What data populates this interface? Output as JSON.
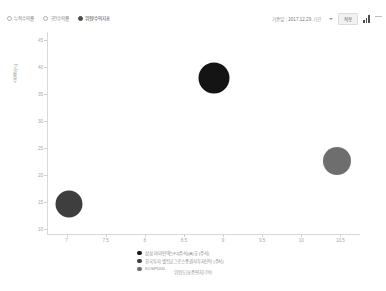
{
  "toolbar": {
    "view_options": [
      {
        "label": "누적수익률",
        "selected": false
      },
      {
        "label": "구간수익률",
        "selected": false
      },
      {
        "label": "위험/수익지표",
        "selected": true
      }
    ],
    "date_label": "기준일",
    "date_value": ": 2017.12.29",
    "date_unit": "기간",
    "apply_label": "적용",
    "chart_icon": "bar-chart-icon",
    "more_icon": "more-menu-icon"
  },
  "chart_data": {
    "type": "scatter",
    "title": "",
    "xlabel": "위험도(표준편차) (%)",
    "ylabel": "수익률 (%)",
    "xlim": [
      6.75,
      10.75
    ],
    "ylim": [
      9.0,
      46.5
    ],
    "xticks": [
      "7",
      "7.5",
      "8",
      "8.5",
      "9",
      "9.5",
      "10",
      "10.5"
    ],
    "xtick_values": [
      7,
      7.5,
      8,
      8.5,
      9,
      9.5,
      10,
      10.5
    ],
    "yticks": [
      "45",
      "40",
      "35",
      "30",
      "25",
      "20",
      "15",
      "10"
    ],
    "ytick_values": [
      45,
      40,
      35,
      30,
      25,
      20,
      15,
      10
    ],
    "grid": false,
    "legend_position": "bottom",
    "series": [
      {
        "name": "삼성 마이인덱스F1[주식](A)호 (주식)",
        "color": "#141414",
        "x": 8.88,
        "y": 38.0,
        "size": 15.5
      },
      {
        "name": "한국투자 벨트남그로스증권자투자신탁 (주식)",
        "color": "#3e3e3e",
        "x": 7.03,
        "y": 14.6,
        "size": 13.5
      },
      {
        "name": "KOSPI200",
        "color": "#6e6e6e",
        "x": 10.46,
        "y": 22.5,
        "size": 14.0
      }
    ]
  }
}
